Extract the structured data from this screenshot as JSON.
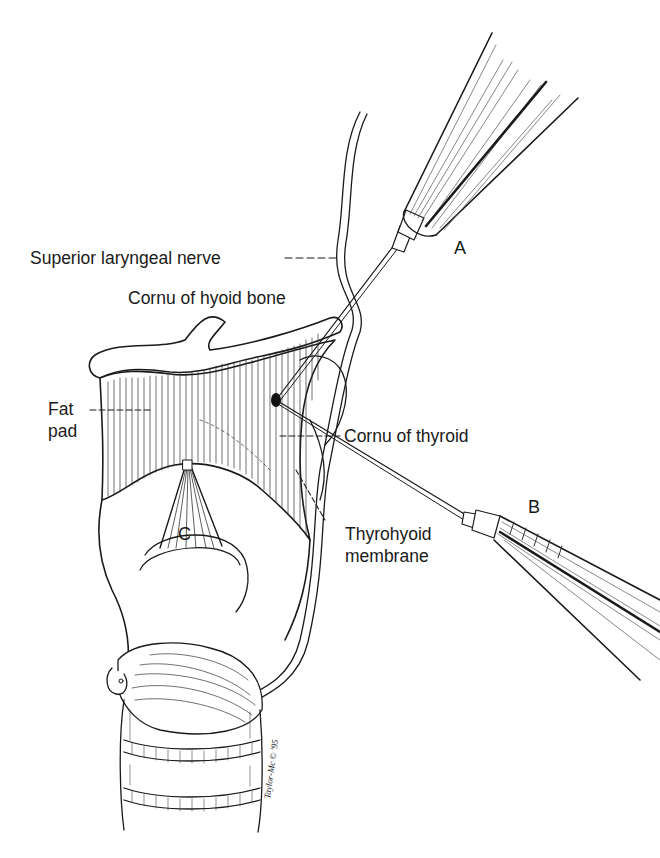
{
  "figure": {
    "labels": {
      "superior_laryngeal_nerve": "Superior laryngeal nerve",
      "cornu_hyoid": "Cornu of hyoid bone",
      "fat_pad_line1": "Fat",
      "fat_pad_line2": "pad",
      "cornu_thyroid": "Cornu of thyroid",
      "thyrohyoid_line1": "Thyrohyoid",
      "thyrohyoid_line2": "membrane"
    },
    "needle_labels": {
      "a": "A",
      "b": "B",
      "c": "C"
    },
    "signature": "Taylor-Mc © '95",
    "colors": {
      "ink": "#1a1a1a",
      "background": "#ffffff"
    }
  }
}
